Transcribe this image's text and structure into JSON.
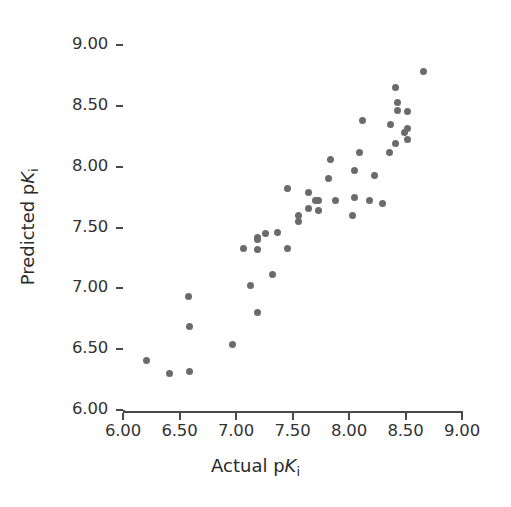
{
  "chart_data": {
    "type": "scatter",
    "title": "",
    "xlabel": "Actual pKi",
    "ylabel": "Predicted pKi",
    "xlabel_parts": {
      "prefix": "Actual p",
      "italic": "K",
      "subscript": "i"
    },
    "ylabel_parts": {
      "prefix": "Predicted p",
      "italic": "K",
      "subscript": "i"
    },
    "xlim": [
      6.0,
      9.0
    ],
    "ylim": [
      6.0,
      9.0
    ],
    "xticks": [
      6.0,
      6.5,
      7.0,
      7.5,
      8.0,
      8.5,
      9.0
    ],
    "yticks": [
      6.0,
      6.5,
      7.0,
      7.5,
      8.0,
      8.5,
      9.0
    ],
    "xtick_labels": [
      "6.00",
      "6.50",
      "7.00",
      "7.50",
      "8.00",
      "8.50",
      "9.00"
    ],
    "ytick_labels": [
      "6.00",
      "6.50",
      "7.00",
      "7.50",
      "8.00",
      "8.50",
      "9.00"
    ],
    "grid": false,
    "legend": null,
    "marker_color": "#6b6b6b",
    "axis_color": "#4a4a4a",
    "marker_size": 7,
    "points": [
      {
        "x": 6.21,
        "y": 6.41
      },
      {
        "x": 6.41,
        "y": 6.3
      },
      {
        "x": 6.59,
        "y": 6.32
      },
      {
        "x": 6.58,
        "y": 6.93
      },
      {
        "x": 6.59,
        "y": 6.69
      },
      {
        "x": 6.97,
        "y": 6.54
      },
      {
        "x": 7.19,
        "y": 6.8
      },
      {
        "x": 7.13,
        "y": 7.02
      },
      {
        "x": 7.19,
        "y": 7.32
      },
      {
        "x": 7.07,
        "y": 7.33
      },
      {
        "x": 7.32,
        "y": 7.11
      },
      {
        "x": 7.19,
        "y": 7.42
      },
      {
        "x": 7.26,
        "y": 7.45
      },
      {
        "x": 7.19,
        "y": 7.4
      },
      {
        "x": 7.37,
        "y": 7.46
      },
      {
        "x": 7.46,
        "y": 7.33
      },
      {
        "x": 7.46,
        "y": 7.82
      },
      {
        "x": 7.55,
        "y": 7.6
      },
      {
        "x": 7.64,
        "y": 7.66
      },
      {
        "x": 7.55,
        "y": 7.55
      },
      {
        "x": 7.64,
        "y": 7.79
      },
      {
        "x": 7.73,
        "y": 7.64
      },
      {
        "x": 7.73,
        "y": 7.72
      },
      {
        "x": 7.82,
        "y": 7.9
      },
      {
        "x": 7.84,
        "y": 8.06
      },
      {
        "x": 7.7,
        "y": 7.72
      },
      {
        "x": 7.88,
        "y": 7.72
      },
      {
        "x": 8.03,
        "y": 7.6
      },
      {
        "x": 8.05,
        "y": 7.75
      },
      {
        "x": 8.05,
        "y": 7.97
      },
      {
        "x": 8.09,
        "y": 8.12
      },
      {
        "x": 8.12,
        "y": 8.38
      },
      {
        "x": 8.23,
        "y": 7.93
      },
      {
        "x": 8.18,
        "y": 7.72
      },
      {
        "x": 8.3,
        "y": 7.7
      },
      {
        "x": 8.36,
        "y": 8.12
      },
      {
        "x": 8.37,
        "y": 8.35
      },
      {
        "x": 8.41,
        "y": 8.65
      },
      {
        "x": 8.43,
        "y": 8.53
      },
      {
        "x": 8.41,
        "y": 8.19
      },
      {
        "x": 8.49,
        "y": 8.28
      },
      {
        "x": 8.52,
        "y": 8.45
      },
      {
        "x": 8.52,
        "y": 8.31
      },
      {
        "x": 8.52,
        "y": 8.22
      },
      {
        "x": 8.43,
        "y": 8.46
      },
      {
        "x": 8.66,
        "y": 8.78
      }
    ]
  }
}
